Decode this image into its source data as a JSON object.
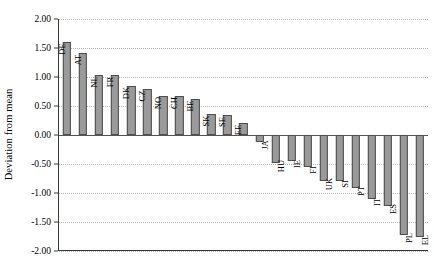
{
  "chart_data": {
    "type": "bar",
    "title": "",
    "subtitle": "",
    "xlabel": "",
    "ylabel": "Deviation from mean",
    "ylim": [
      -2.0,
      2.0
    ],
    "grid": true,
    "legend": "none",
    "orientation": "vertical",
    "bar_label_rotation": -90,
    "categories": [
      "DE",
      "AT",
      "NL",
      "FR",
      "DK",
      "CZ",
      "NO",
      "CH",
      "BE",
      "SK",
      "SE",
      "EE",
      "JA",
      "HU",
      "IE",
      "FI",
      "UK",
      "SI",
      "PT",
      "IT",
      "ES",
      "PL",
      "EL"
    ],
    "values": [
      1.6,
      1.42,
      1.04,
      1.04,
      0.85,
      0.8,
      0.68,
      0.68,
      0.62,
      0.37,
      0.35,
      0.2,
      -0.12,
      -0.48,
      -0.45,
      -0.55,
      -0.8,
      -0.8,
      -0.92,
      -1.1,
      -1.22,
      -1.72,
      -1.75
    ],
    "yticks": [
      2.0,
      1.5,
      1.0,
      0.5,
      0.0,
      -0.5,
      -1.0,
      -1.5,
      -2.0
    ],
    "ytick_labels": [
      "2.00",
      "1.50",
      "1.00",
      "0.50",
      "0.00",
      "-0.50",
      "-1.00",
      "-1.50",
      "-2.00"
    ],
    "colors": {
      "bar_fill": "#9a9a9a",
      "bar_stroke": "#4d4d4d",
      "grid": "#b4b4b4",
      "axis": "#3a3a3a",
      "zero_line": "#555555",
      "text": "#000000",
      "background": "#ffffff"
    }
  }
}
